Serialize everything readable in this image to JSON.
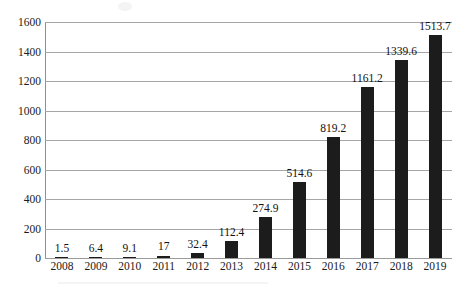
{
  "chart_data": {
    "type": "bar",
    "title": "",
    "subtitle": "",
    "xlabel": "",
    "ylabel": "",
    "categories": [
      "2008",
      "2009",
      "2010",
      "2011",
      "2012",
      "2013",
      "2014",
      "2015",
      "2016",
      "2017",
      "2018",
      "2019"
    ],
    "values": [
      1.5,
      6.4,
      9.1,
      17,
      32.4,
      112.4,
      274.9,
      514.6,
      819.2,
      1161.2,
      1339.6,
      1513.7
    ],
    "data_labels": [
      "1.5",
      "6.4",
      "9.1",
      "17",
      "32.4",
      "112.4",
      "274.9",
      "514.6",
      "819.2",
      "1161.2",
      "1339.6",
      "1513.7"
    ],
    "ylim": [
      0,
      1600
    ],
    "ytick_values": [
      0,
      200,
      400,
      600,
      800,
      1000,
      1200,
      1400,
      1600
    ],
    "ytick_labels": [
      "0",
      "200",
      "400",
      "600",
      "800",
      "1000",
      "1200",
      "1400",
      "1600"
    ],
    "grid": "horizontal",
    "legend": "none",
    "series": [
      {
        "name": "",
        "values": [
          1.5,
          6.4,
          9.1,
          17,
          32.4,
          112.4,
          274.9,
          514.6,
          819.2,
          1161.2,
          1339.6,
          1513.7
        ]
      }
    ]
  },
  "style": {
    "bar_color": "#1c1c1c",
    "gridline_color": "#a6a6a6",
    "axis_color": "#8f8f8f",
    "text_color": "#1a1a1a",
    "background_color": "#ffffff"
  }
}
